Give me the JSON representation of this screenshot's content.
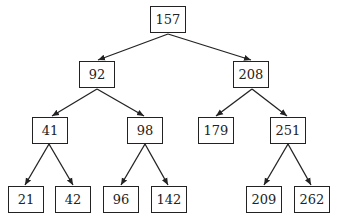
{
  "diagram": {
    "type": "binary-search-tree",
    "nodes": [
      {
        "id": "n157",
        "label": "157",
        "x": 150,
        "y": 6
      },
      {
        "id": "n92",
        "label": "92",
        "x": 79,
        "y": 61
      },
      {
        "id": "n208",
        "label": "208",
        "x": 233,
        "y": 61
      },
      {
        "id": "n41",
        "label": "41",
        "x": 32,
        "y": 117
      },
      {
        "id": "n98",
        "label": "98",
        "x": 127,
        "y": 117
      },
      {
        "id": "n179",
        "label": "179",
        "x": 198,
        "y": 117
      },
      {
        "id": "n251",
        "label": "251",
        "x": 270,
        "y": 117
      },
      {
        "id": "n21",
        "label": "21",
        "x": 8,
        "y": 186
      },
      {
        "id": "n42",
        "label": "42",
        "x": 55,
        "y": 186
      },
      {
        "id": "n96",
        "label": "96",
        "x": 103,
        "y": 186
      },
      {
        "id": "n142",
        "label": "142",
        "x": 151,
        "y": 186
      },
      {
        "id": "n209",
        "label": "209",
        "x": 246,
        "y": 186
      },
      {
        "id": "n262",
        "label": "262",
        "x": 294,
        "y": 186
      }
    ],
    "edges": [
      {
        "from": "157",
        "to": "92"
      },
      {
        "from": "157",
        "to": "208"
      },
      {
        "from": "92",
        "to": "41"
      },
      {
        "from": "92",
        "to": "98"
      },
      {
        "from": "208",
        "to": "179"
      },
      {
        "from": "208",
        "to": "251"
      },
      {
        "from": "41",
        "to": "21"
      },
      {
        "from": "41",
        "to": "42"
      },
      {
        "from": "98",
        "to": "96"
      },
      {
        "from": "98",
        "to": "142"
      },
      {
        "from": "251",
        "to": "209"
      },
      {
        "from": "251",
        "to": "262"
      }
    ],
    "colors": {
      "stroke": "#222222",
      "background": "#ffffff"
    }
  }
}
